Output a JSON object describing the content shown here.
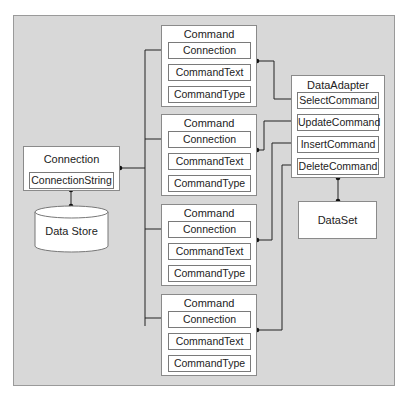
{
  "diagram": {
    "connection": {
      "title": "Connection",
      "property": "ConnectionString"
    },
    "data_store": {
      "label": "Data Store"
    },
    "commands": [
      {
        "title": "Command",
        "properties": [
          "Connection",
          "CommandText",
          "CommandType"
        ]
      },
      {
        "title": "Command",
        "properties": [
          "Connection",
          "CommandText",
          "CommandType"
        ]
      },
      {
        "title": "Command",
        "properties": [
          "Connection",
          "CommandText",
          "CommandType"
        ]
      },
      {
        "title": "Command",
        "properties": [
          "Connection",
          "CommandText",
          "CommandType"
        ]
      }
    ],
    "data_adapter": {
      "title": "DataAdapter",
      "properties": [
        "SelectCommand",
        "UpdateCommand",
        "InsertCommand",
        "DeleteCommand"
      ]
    },
    "data_set": {
      "label": "DataSet"
    },
    "colors": {
      "panel": "#d8d8d8",
      "box": "#ffffff",
      "line": "#222222"
    }
  }
}
